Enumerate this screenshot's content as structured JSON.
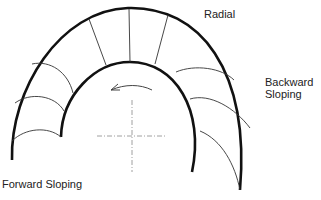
{
  "diagram": {
    "labels": {
      "radial": "Radial",
      "backward_line1": "Backward",
      "backward_line2": "Sloping",
      "forward": "Forward Sloping"
    },
    "icons": {
      "rotation_arrow": "counterclockwise-arrow-icon",
      "center_mark": "centerline-crosshair-icon"
    },
    "colors": {
      "stroke": "#111111",
      "blade": "#333333",
      "centerline": "#888888",
      "text": "#222222"
    },
    "sections": [
      {
        "name": "Forward Sloping",
        "blade_count": 3
      },
      {
        "name": "Radial",
        "blade_count": 3
      },
      {
        "name": "Backward Sloping",
        "blade_count": 3
      }
    ]
  }
}
